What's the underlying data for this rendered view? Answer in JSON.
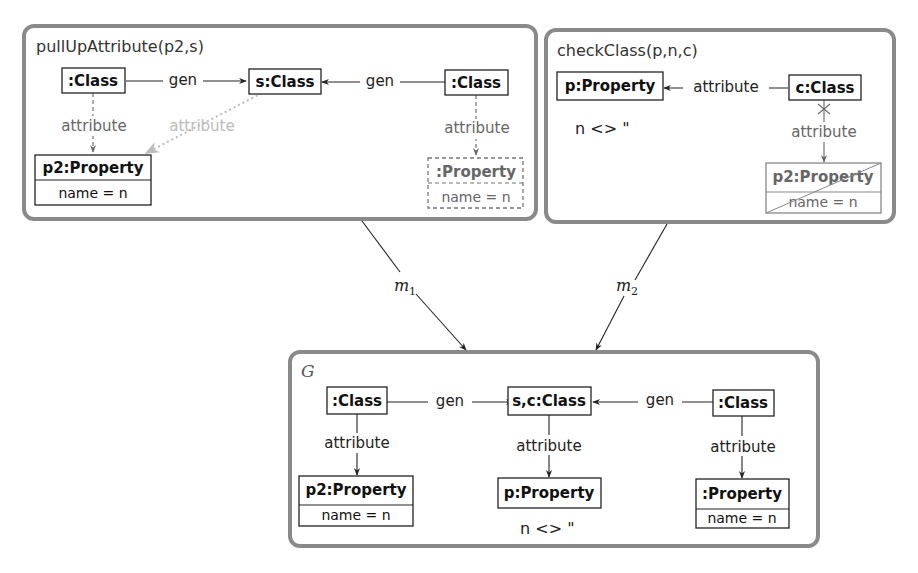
{
  "diagram": {
    "panels": [
      {
        "id": "pullUpAttribute",
        "title": "pullUpAttribute(p2,s)",
        "nodes": [
          {
            "id": "c1",
            "label": ":Class",
            "style": "solid"
          },
          {
            "id": "s",
            "label": "s:Class",
            "style": "solid"
          },
          {
            "id": "c2",
            "label": ":Class",
            "style": "solid"
          },
          {
            "id": "p2",
            "label": "p2:Property",
            "attribute": "name = n",
            "style": "solid"
          },
          {
            "id": "p3",
            "label": ":Property",
            "attribute": "name = n",
            "style": "dashed"
          }
        ],
        "edges": [
          {
            "from": "c1",
            "to": "s",
            "label": "gen",
            "style": "solid"
          },
          {
            "from": "c2",
            "to": "s",
            "label": "gen",
            "style": "solid"
          },
          {
            "from": "c1",
            "to": "p2",
            "label": "attribute",
            "style": "dashed"
          },
          {
            "from": "s",
            "to": "p2",
            "label": "attribute",
            "style": "dotted-light"
          },
          {
            "from": "c2",
            "to": "p3",
            "label": "attribute",
            "style": "dashed"
          }
        ]
      },
      {
        "id": "checkClass",
        "title": "checkClass(p,n,c)",
        "nodes": [
          {
            "id": "p",
            "label": "p:Property",
            "style": "solid"
          },
          {
            "id": "c",
            "label": "c:Class",
            "style": "solid"
          },
          {
            "id": "p2",
            "label": "p2:Property",
            "attribute": "name = n",
            "style": "forbidden"
          }
        ],
        "edges": [
          {
            "from": "c",
            "to": "p",
            "label": "attribute",
            "style": "solid"
          },
          {
            "from": "c",
            "to": "p2",
            "label": "attribute",
            "style": "forbidden"
          }
        ],
        "condition": "n <> ''"
      },
      {
        "id": "G",
        "title": "G",
        "nodes": [
          {
            "id": "c1",
            "label": ":Class",
            "style": "solid"
          },
          {
            "id": "sc",
            "label": "s,c:Class",
            "style": "solid"
          },
          {
            "id": "c2",
            "label": ":Class",
            "style": "solid"
          },
          {
            "id": "p2",
            "label": "p2:Property",
            "attribute": "name = n",
            "style": "solid"
          },
          {
            "id": "p",
            "label": "p:Property",
            "style": "solid"
          },
          {
            "id": "p3",
            "label": ":Property",
            "attribute": "name = n",
            "style": "solid"
          }
        ],
        "edges": [
          {
            "from": "c1",
            "to": "sc",
            "label": "gen"
          },
          {
            "from": "c2",
            "to": "sc",
            "label": "gen"
          },
          {
            "from": "c1",
            "to": "p2",
            "label": "attribute"
          },
          {
            "from": "sc",
            "to": "p",
            "label": "attribute"
          },
          {
            "from": "c2",
            "to": "p3",
            "label": "attribute"
          }
        ],
        "condition": "n <> ''"
      }
    ],
    "morphisms": [
      {
        "name": "m",
        "subscript": "1",
        "from": "pullUpAttribute",
        "to": "G"
      },
      {
        "name": "m",
        "subscript": "2",
        "from": "checkClass",
        "to": "G"
      }
    ],
    "colors": {
      "frame": "#8a8a8a",
      "edge": "#222222",
      "nac": "#666666",
      "light": "#bbbbbb"
    }
  },
  "labels": {
    "cond_text": "n <>  \""
  }
}
